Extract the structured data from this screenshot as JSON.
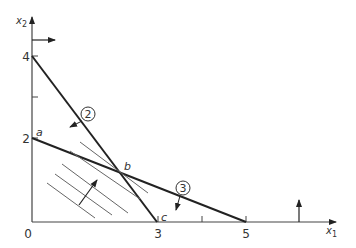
{
  "diagram": {
    "type": "linear-programming-graph",
    "axes": {
      "x_label": "x",
      "x_sub": "1",
      "y_label": "x",
      "y_sub": "2",
      "origin_label": "0",
      "x_ticks": [
        {
          "value": 3,
          "label": "3"
        },
        {
          "value": 4,
          "label": ""
        },
        {
          "value": 5,
          "label": "5"
        }
      ],
      "y_ticks": [
        {
          "value": 2,
          "label": "2"
        },
        {
          "value": 3,
          "label": ""
        },
        {
          "value": 4,
          "label": "4"
        }
      ]
    },
    "constraints": [
      {
        "id": "2",
        "label": "2",
        "x_intercept": 3,
        "y_intercept": 4
      },
      {
        "id": "3",
        "label": "3",
        "x_intercept": 5,
        "y_intercept": 2
      }
    ],
    "points": [
      {
        "name": "a",
        "label": "a",
        "x": 0,
        "y": 2
      },
      {
        "name": "b",
        "label": "b",
        "x": 2.14,
        "y": 1.14
      },
      {
        "name": "c",
        "label": "c",
        "x": 3,
        "y": 0
      }
    ],
    "objective_contours": 5,
    "colors": {
      "line": "#222222",
      "hatch": "#555555",
      "text": "#333333"
    }
  }
}
